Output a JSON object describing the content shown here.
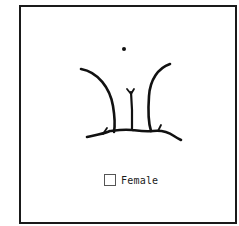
{
  "figure": {
    "stroke_color": "#111111",
    "frame_color": "#1a1a1a"
  },
  "legend": {
    "checkbox_checked": false,
    "label": "Female"
  }
}
